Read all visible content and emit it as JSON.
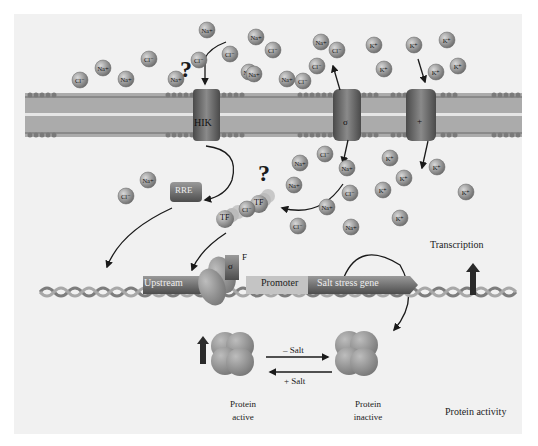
{
  "diagram": {
    "membrane": {
      "channels": [
        {
          "id": "hik",
          "label": "HIK",
          "x": 207
        },
        {
          "id": "sigma_channel",
          "label": "σ",
          "x": 348
        },
        {
          "id": "plus_channel",
          "label": "+",
          "x": 421
        }
      ]
    },
    "ions_outside": [
      {
        "label": "Cl⁻",
        "x": 80,
        "y": 80
      },
      {
        "label": "Na+",
        "x": 103,
        "y": 68
      },
      {
        "label": "Na+",
        "x": 126,
        "y": 79
      },
      {
        "label": "Cl⁻",
        "x": 149,
        "y": 59
      },
      {
        "label": "Na+",
        "x": 176,
        "y": 79
      },
      {
        "label": "Cl⁻",
        "x": 199,
        "y": 60
      },
      {
        "label": "Na+",
        "x": 207,
        "y": 30
      },
      {
        "label": "Cl⁻",
        "x": 230,
        "y": 54
      },
      {
        "label": "Na+",
        "x": 249,
        "y": 72
      },
      {
        "label": "Na+",
        "x": 256,
        "y": 37
      },
      {
        "label": "Cl⁻",
        "x": 273,
        "y": 50
      },
      {
        "label": "Na+",
        "x": 254,
        "y": 74
      },
      {
        "label": "Na+",
        "x": 287,
        "y": 79
      },
      {
        "label": "Cl⁻",
        "x": 303,
        "y": 81
      },
      {
        "label": "Cl⁻",
        "x": 317,
        "y": 66
      },
      {
        "label": "Na+",
        "x": 321,
        "y": 42
      },
      {
        "label": "Cl⁻",
        "x": 337,
        "y": 50
      },
      {
        "label": "K⁺",
        "x": 374,
        "y": 45
      },
      {
        "label": "K⁺",
        "x": 384,
        "y": 69
      },
      {
        "label": "K⁺",
        "x": 414,
        "y": 45
      },
      {
        "label": "K⁺",
        "x": 436,
        "y": 72
      },
      {
        "label": "K⁺",
        "x": 447,
        "y": 40
      },
      {
        "label": "K⁺",
        "x": 458,
        "y": 66
      }
    ],
    "ions_inside": [
      {
        "label": "Na+",
        "x": 148,
        "y": 180
      },
      {
        "label": "Cl⁻",
        "x": 126,
        "y": 196
      },
      {
        "label": "Cl⁻",
        "x": 247,
        "y": 209
      },
      {
        "label": "Na+",
        "x": 300,
        "y": 163
      },
      {
        "label": "Cl⁻",
        "x": 325,
        "y": 154
      },
      {
        "label": "Na+",
        "x": 347,
        "y": 168
      },
      {
        "label": "Na+",
        "x": 294,
        "y": 185
      },
      {
        "label": "Cl⁻",
        "x": 350,
        "y": 193
      },
      {
        "label": "Na+",
        "x": 327,
        "y": 207
      },
      {
        "label": "Cl⁻",
        "x": 298,
        "y": 226
      },
      {
        "label": "Na+",
        "x": 351,
        "y": 227
      },
      {
        "label": "K⁺",
        "x": 390,
        "y": 158
      },
      {
        "label": "K⁺",
        "x": 404,
        "y": 178
      },
      {
        "label": "K⁺",
        "x": 437,
        "y": 167
      },
      {
        "label": "K⁺",
        "x": 383,
        "y": 190
      },
      {
        "label": "K⁺",
        "x": 466,
        "y": 192
      },
      {
        "label": "K⁺",
        "x": 400,
        "y": 218
      }
    ],
    "question_marks": [
      {
        "text": "?",
        "x": 183,
        "y": 64
      },
      {
        "text": "?",
        "x": 264,
        "y": 170
      }
    ],
    "rre": {
      "label": "RRE",
      "x": 180,
      "y": 202
    },
    "tf": [
      {
        "label": "TF",
        "x": 225,
        "y": 218
      },
      {
        "label": "TF",
        "x": 260,
        "y": 202
      }
    ],
    "sigma_factor": {
      "label": "σ",
      "superscript": "F",
      "x": 233,
      "y": 272
    },
    "dna": {
      "segments": [
        {
          "label": "Upstream",
          "x": 143,
          "width": 80
        },
        {
          "label": "Promoter",
          "x": 248,
          "width": 72
        },
        {
          "label": "Salt stress gene",
          "x": 308,
          "width": 112
        }
      ],
      "y": 286
    },
    "labels": {
      "transcription": "Transcription",
      "protein_activity": "Protein activity",
      "protein_active_line1": "Protein",
      "protein_active_line2": "active",
      "protein_inactive_line1": "Protein",
      "protein_inactive_line2": "inactive",
      "minus_salt": "– Salt",
      "plus_salt": "+ Salt"
    },
    "colors": {
      "background": "#f1f1f1",
      "membrane_band": "#a9a9a9",
      "ion_fill": "#8c8c8c",
      "channel": "#6e6e6e",
      "arrow": "#1a1a1a",
      "up_arrow": "#2a2a2a",
      "text": "#222222"
    }
  }
}
